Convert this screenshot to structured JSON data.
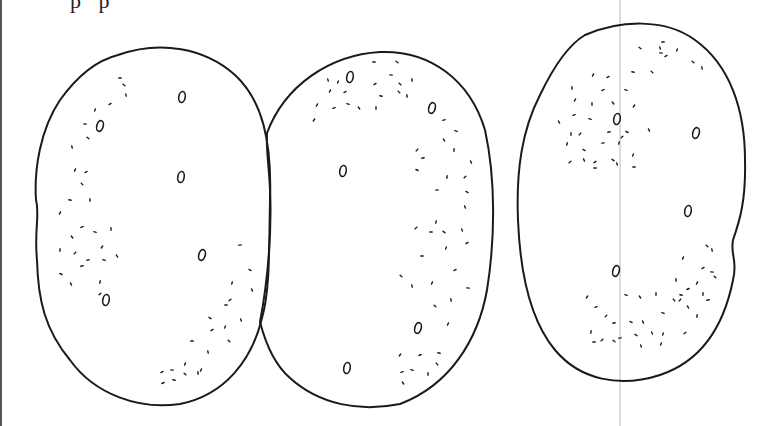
{
  "figure": {
    "top_text_fragment": "p  p",
    "stroke_color": "#1a1a1a",
    "background": "#ffffff",
    "guide_line_color": "#b0b0b0"
  },
  "shapes": [
    {
      "id": "oval-left",
      "center": [
        151,
        252
      ],
      "loops": [
        [
          182,
          97
        ],
        [
          100,
          126
        ],
        [
          181,
          177
        ],
        [
          202,
          255
        ],
        [
          106,
          300
        ]
      ],
      "dots": [
        [
          120,
          78
        ],
        [
          124,
          85
        ],
        [
          126,
          95
        ],
        [
          95,
          110
        ],
        [
          110,
          104
        ],
        [
          85,
          124
        ],
        [
          88,
          138
        ],
        [
          72,
          147
        ],
        [
          75,
          170
        ],
        [
          86,
          172
        ],
        [
          70,
          200
        ],
        [
          82,
          184
        ],
        [
          90,
          200
        ],
        [
          60,
          213
        ],
        [
          82,
          227
        ],
        [
          95,
          232
        ],
        [
          72,
          237
        ],
        [
          111,
          229
        ],
        [
          102,
          247
        ],
        [
          88,
          260
        ],
        [
          104,
          260
        ],
        [
          117,
          256
        ],
        [
          60,
          250
        ],
        [
          75,
          253
        ],
        [
          82,
          266
        ],
        [
          61,
          274
        ],
        [
          71,
          284
        ],
        [
          100,
          282
        ],
        [
          100,
          294
        ],
        [
          240,
          245
        ],
        [
          250,
          270
        ],
        [
          252,
          290
        ],
        [
          232,
          283
        ],
        [
          230,
          300
        ],
        [
          226,
          305
        ],
        [
          210,
          318
        ],
        [
          241,
          320
        ],
        [
          225,
          327
        ],
        [
          212,
          330
        ],
        [
          192,
          341
        ],
        [
          229,
          341
        ],
        [
          208,
          352
        ],
        [
          185,
          364
        ],
        [
          162,
          372
        ],
        [
          172,
          370
        ],
        [
          185,
          374
        ],
        [
          198,
          373
        ],
        [
          201,
          370
        ],
        [
          163,
          383
        ],
        [
          174,
          380
        ]
      ]
    },
    {
      "id": "oval-middle",
      "center": [
        370,
        257
      ],
      "loops": [
        [
          350,
          77
        ],
        [
          432,
          108
        ],
        [
          343,
          171
        ],
        [
          418,
          328
        ],
        [
          347,
          368
        ]
      ],
      "dots": [
        [
          374,
          62
        ],
        [
          397,
          62
        ],
        [
          328,
          80
        ],
        [
          338,
          82
        ],
        [
          375,
          84
        ],
        [
          391,
          75
        ],
        [
          400,
          84
        ],
        [
          412,
          80
        ],
        [
          330,
          91
        ],
        [
          345,
          92
        ],
        [
          381,
          96
        ],
        [
          399,
          92
        ],
        [
          407,
          96
        ],
        [
          317,
          105
        ],
        [
          334,
          108
        ],
        [
          348,
          104
        ],
        [
          359,
          108
        ],
        [
          376,
          108
        ],
        [
          314,
          120
        ],
        [
          444,
          120
        ],
        [
          456,
          131
        ],
        [
          444,
          140
        ],
        [
          454,
          150
        ],
        [
          417,
          150
        ],
        [
          423,
          158
        ],
        [
          417,
          170
        ],
        [
          471,
          162
        ],
        [
          447,
          177
        ],
        [
          465,
          177
        ],
        [
          437,
          190
        ],
        [
          467,
          192
        ],
        [
          465,
          207
        ],
        [
          436,
          222
        ],
        [
          416,
          228
        ],
        [
          431,
          232
        ],
        [
          444,
          232
        ],
        [
          462,
          230
        ],
        [
          446,
          248
        ],
        [
          467,
          243
        ],
        [
          422,
          256
        ],
        [
          401,
          276
        ],
        [
          412,
          286
        ],
        [
          432,
          283
        ],
        [
          455,
          270
        ],
        [
          468,
          288
        ],
        [
          435,
          306
        ],
        [
          451,
          300
        ],
        [
          448,
          324
        ],
        [
          420,
          355
        ],
        [
          439,
          353
        ],
        [
          437,
          364
        ],
        [
          428,
          374
        ],
        [
          400,
          355
        ],
        [
          402,
          372
        ],
        [
          412,
          370
        ],
        [
          403,
          383
        ]
      ]
    },
    {
      "id": "oval-right",
      "center": [
        628,
        202
      ],
      "loops": [
        [
          617,
          119
        ],
        [
          696,
          133
        ],
        [
          688,
          211
        ],
        [
          616,
          271
        ]
      ],
      "dots": [
        [
          663,
          42
        ],
        [
          640,
          48
        ],
        [
          660,
          48
        ],
        [
          677,
          50
        ],
        [
          666,
          56
        ],
        [
          661,
          53
        ],
        [
          693,
          62
        ],
        [
          702,
          68
        ],
        [
          593,
          75
        ],
        [
          608,
          77
        ],
        [
          633,
          72
        ],
        [
          652,
          72
        ],
        [
          572,
          88
        ],
        [
          575,
          100
        ],
        [
          603,
          90
        ],
        [
          626,
          90
        ],
        [
          613,
          103
        ],
        [
          592,
          104
        ],
        [
          634,
          106
        ],
        [
          574,
          115
        ],
        [
          590,
          119
        ],
        [
          559,
          122
        ],
        [
          571,
          134
        ],
        [
          580,
          134
        ],
        [
          609,
          132
        ],
        [
          627,
          132
        ],
        [
          649,
          130
        ],
        [
          567,
          144
        ],
        [
          622,
          137
        ],
        [
          603,
          143
        ],
        [
          584,
          150
        ],
        [
          584,
          160
        ],
        [
          619,
          143
        ],
        [
          570,
          162
        ],
        [
          595,
          168
        ],
        [
          613,
          160
        ],
        [
          617,
          164
        ],
        [
          633,
          155
        ],
        [
          595,
          162
        ],
        [
          634,
          167
        ],
        [
          707,
          246
        ],
        [
          712,
          250
        ],
        [
          683,
          258
        ],
        [
          703,
          268
        ],
        [
          712,
          272
        ],
        [
          715,
          277
        ],
        [
          676,
          280
        ],
        [
          697,
          283
        ],
        [
          688,
          289
        ],
        [
          681,
          295
        ],
        [
          674,
          300
        ],
        [
          703,
          294
        ],
        [
          587,
          297
        ],
        [
          596,
          307
        ],
        [
          626,
          295
        ],
        [
          640,
          297
        ],
        [
          656,
          294
        ],
        [
          680,
          300
        ],
        [
          708,
          300
        ],
        [
          663,
          313
        ],
        [
          688,
          307
        ],
        [
          697,
          316
        ],
        [
          606,
          316
        ],
        [
          614,
          323
        ],
        [
          631,
          322
        ],
        [
          643,
          322
        ],
        [
          591,
          332
        ],
        [
          602,
          340
        ],
        [
          620,
          338
        ],
        [
          636,
          335
        ],
        [
          652,
          333
        ],
        [
          663,
          334
        ],
        [
          685,
          333
        ],
        [
          594,
          342
        ],
        [
          614,
          341
        ],
        [
          641,
          346
        ],
        [
          661,
          344
        ]
      ]
    }
  ]
}
